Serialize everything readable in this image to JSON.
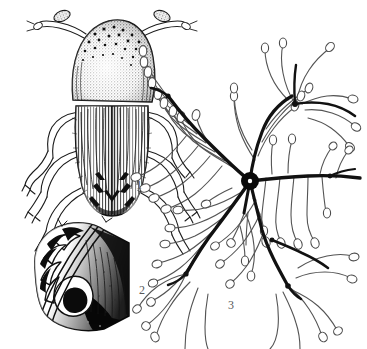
{
  "plate": {
    "title": "Bark beetle plate",
    "background_color": "#ffffff",
    "ink_color": "#161616",
    "label_color": "#58595b",
    "width": 367,
    "height": 349
  },
  "figures": [
    {
      "number": "1",
      "name": "beetle-dorsal-habitus",
      "caption": "1",
      "label_x": 136,
      "label_y": 179,
      "description": "Dorsal view of adult bark beetle with granulate pronotum, striate elytra, antennae and legs"
    },
    {
      "number": "2",
      "name": "elytral-declivity-detail",
      "caption": "2",
      "label_x": 139,
      "label_y": 284,
      "description": "Oblique view of elytral declivity with toothed lateral margin"
    },
    {
      "number": "3",
      "name": "gallery-system",
      "caption": "3",
      "label_x": 228,
      "label_y": 299,
      "description": "Star-shaped gallery system: central nuptial chamber, radiating maternal galleries and slender larval mines"
    }
  ],
  "gallery": {
    "hub": {
      "cx": 250,
      "cy": 181,
      "r_outer": 9,
      "r_inner": 2.2
    },
    "maternal_galleries": [
      {
        "name": "gallery-northwest",
        "path": "M250,181 C236,170 220,154 205,139 C192,126 180,112 168,96"
      },
      {
        "name": "gallery-north",
        "path": "M250,181 C252,164 256,148 262,132 C268,116 278,104 292,96"
      },
      {
        "name": "gallery-east",
        "path": "M250,181 C268,179 288,177 308,176 C326,175 344,176 360,178"
      },
      {
        "name": "gallery-southwest",
        "path": "M250,181 C240,196 228,212 216,228 C205,242 195,258 186,274"
      },
      {
        "name": "gallery-south",
        "path": "M250,181 C254,198 258,214 262,230 C268,250 278,268 288,286"
      },
      {
        "name": "gallery-short-south",
        "path": "M250,181 C248,192 246,202 244,213"
      }
    ],
    "branch_nodes": [
      {
        "name": "node-upper-left",
        "cx": 168,
        "cy": 96
      },
      {
        "name": "node-upper-right",
        "cx": 295,
        "cy": 104
      },
      {
        "name": "node-lower-left",
        "cx": 186,
        "cy": 274
      },
      {
        "name": "node-lower-right",
        "cx": 288,
        "cy": 286
      },
      {
        "name": "node-right-arm",
        "cx": 330,
        "cy": 176
      },
      {
        "name": "node-southeast",
        "cx": 272,
        "cy": 240
      }
    ],
    "larval_mine_count": 46
  }
}
